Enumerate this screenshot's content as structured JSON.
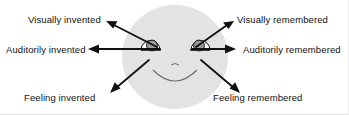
{
  "figure": {
    "name": "eye-accessing-cues-diagram",
    "background_color": "#ffffff",
    "stroke_color": "#111111"
  },
  "face": {
    "name": "face",
    "fill_color": "#e3e3e3",
    "center_x": 175,
    "center_y": 57,
    "radius_x": 53,
    "radius_y": 52,
    "eye_iris_color": "#9a9a9a",
    "eye_white_color": "#ffffff",
    "mouth": "smile",
    "nose": "small-curve"
  },
  "labels": {
    "visually_invented": "Visually invented",
    "visually_remembered": "Visually remembered",
    "auditorily_invented": "Auditorily invented",
    "auditorily_remembered": "Auditorily remembered",
    "feeling_invented": "Feeling invented",
    "feeling_remembered": "Feeling remembered"
  },
  "arrows": [
    {
      "name": "arrow-visually-invented",
      "label_key": "visually_invented",
      "direction": "up-left",
      "from_x": 157,
      "from_y": 47,
      "to_x": 106,
      "to_y": 21
    },
    {
      "name": "arrow-visually-remembered",
      "label_key": "visually_remembered",
      "direction": "up-right",
      "from_x": 196,
      "from_y": 47,
      "to_x": 234,
      "to_y": 21
    },
    {
      "name": "arrow-auditorily-invented",
      "label_key": "auditorily_invented",
      "direction": "left",
      "from_x": 160,
      "from_y": 49,
      "to_x": 88,
      "to_y": 49
    },
    {
      "name": "arrow-auditorily-remembered",
      "label_key": "auditorily_remembered",
      "direction": "right",
      "from_x": 192,
      "from_y": 49,
      "to_x": 236,
      "to_y": 49
    },
    {
      "name": "arrow-feeling-invented",
      "label_key": "feeling_invented",
      "direction": "down-left",
      "from_x": 149,
      "from_y": 60,
      "to_x": 110,
      "to_y": 93
    },
    {
      "name": "arrow-feeling-remembered",
      "label_key": "feeling_remembered",
      "direction": "down-right",
      "from_x": 201,
      "from_y": 60,
      "to_x": 240,
      "to_y": 93
    }
  ]
}
